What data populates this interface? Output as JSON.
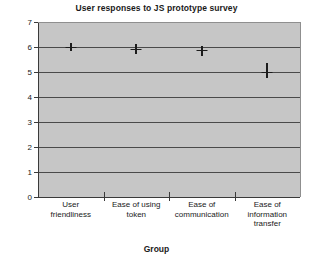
{
  "chart_data": {
    "type": "scatter",
    "title": "User responses to JS prototype survey",
    "xlabel": "Group",
    "ylabel": "Rating",
    "categories": [
      "User friendliness",
      "Ease of using token",
      "Ease of communication",
      "Ease of information transfer"
    ],
    "category_lines": [
      [
        "User",
        "friendliness"
      ],
      [
        "Ease of using",
        "token"
      ],
      [
        "Ease of",
        "communication"
      ],
      [
        "Ease of",
        "information",
        "transfer"
      ]
    ],
    "values": [
      6.0,
      5.93,
      5.87,
      5.0
    ],
    "error_low": [
      5.85,
      5.72,
      5.66,
      4.75
    ],
    "error_high": [
      6.15,
      6.12,
      6.06,
      5.35
    ],
    "ylim": [
      0,
      7
    ],
    "yticks": [
      0,
      1,
      2,
      3,
      4,
      5,
      6,
      7
    ],
    "ytick_labels": [
      "0",
      "1",
      "2",
      "3",
      "4",
      "5",
      "6",
      "7"
    ],
    "grid": true,
    "legend": "none",
    "plot_background": "#c6c6c6",
    "marker_color": "#1c1c1c",
    "axis_color": "#3a3a3a"
  }
}
